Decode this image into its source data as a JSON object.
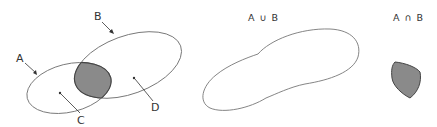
{
  "diagram": {
    "type": "venn",
    "panels": [
      {
        "name": "sets-a-b",
        "labels": {
          "a": "A",
          "b": "B",
          "c": "C",
          "d": "D"
        },
        "description": "Two overlapping ellipses A and B with the overlap shaded"
      },
      {
        "name": "union",
        "title": "A ∪ B"
      },
      {
        "name": "intersection",
        "title": "A ∩ B"
      }
    ],
    "colors": {
      "outline": "#777777",
      "shade": "#8a8a8a",
      "text": "#333333"
    }
  }
}
